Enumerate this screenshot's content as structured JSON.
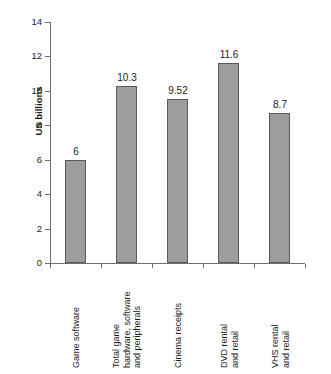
{
  "chart_data": {
    "type": "bar",
    "title": "",
    "xlabel": "",
    "ylabel": "US billions",
    "ylim": [
      0,
      14
    ],
    "ytick_values": [
      0,
      2,
      4,
      6,
      8,
      10,
      12,
      14
    ],
    "ytick_labels": [
      "0",
      "2",
      "4",
      "6",
      "8",
      "10",
      "12",
      "14"
    ],
    "grid": false,
    "legend": false,
    "bar_color": "#9d9d9d",
    "bar_edge_color": "#595959",
    "axis_color": "#6e6e6e",
    "text_color": "#1c1c1c",
    "categories": [
      "Game software",
      "Total game hardware, software and peripherals",
      "Cinema receipts",
      "DVD rental and retail",
      "VHS rental and retail"
    ],
    "category_label_lines": [
      [
        "Game software"
      ],
      [
        "Total game",
        "hardware, software",
        "and peripherals"
      ],
      [
        "Cinema receipts"
      ],
      [
        "DVD rental",
        "and retail"
      ],
      [
        "VHS rental",
        "and retail"
      ]
    ],
    "values": [
      6,
      10.3,
      9.52,
      11.6,
      8.7
    ],
    "value_labels": [
      "6",
      "10.3",
      "9.52",
      "11.6",
      "8.7"
    ]
  }
}
